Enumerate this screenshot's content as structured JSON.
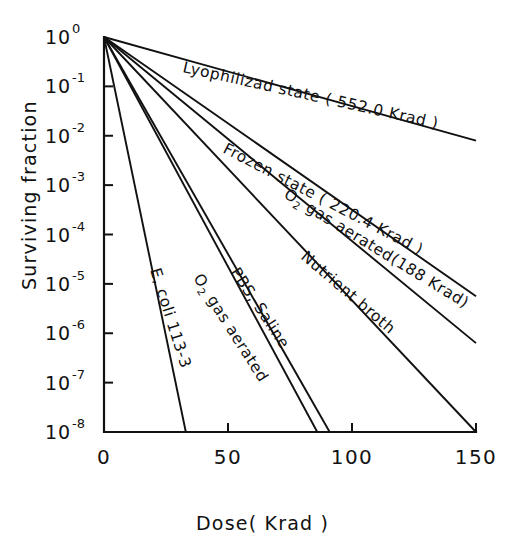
{
  "chart_data": {
    "type": "line",
    "title": "",
    "xlabel": "Dose( Krad )",
    "ylabel": "Surviving fraction",
    "xlim": [
      0,
      150
    ],
    "ylim_log10": [
      -8,
      0
    ],
    "xticks": [
      "0",
      "50",
      "100",
      "150"
    ],
    "xtick_values": [
      0,
      50,
      100,
      150
    ],
    "ytick_labels": [
      "10",
      "10",
      "10",
      "10",
      "10",
      "10",
      "10",
      "10",
      "10"
    ],
    "ytick_exponents": [
      "0",
      "-1",
      "-2",
      "-3",
      "-4",
      "-5",
      "-6",
      "-7",
      "-8"
    ],
    "ytick_values": [
      0,
      -1,
      -2,
      -3,
      -4,
      -5,
      -6,
      -7,
      -8
    ],
    "grid": false,
    "legend": "inline-labels",
    "organism": "E, coli 113-3",
    "series": [
      {
        "name": "Lyophilized state (552.0 Krad)",
        "label": "Lyophilizad    state ( 552.0 Krad )",
        "d10_krad": 552.0,
        "x": [
          0,
          150
        ],
        "y_log10": [
          0,
          -2.1
        ],
        "label_x": 182,
        "label_y": 72,
        "label_rotation": 12.5
      },
      {
        "name": "Frozen state (220.4 Krad)",
        "label": "Frozen state ( 220.4 Krad )",
        "d10_krad": 220.4,
        "x": [
          0,
          150
        ],
        "y_log10": [
          0,
          -5.25
        ],
        "label_x": 222,
        "label_y": 152,
        "label_rotation": 27.5
      },
      {
        "name": "O2 gas aerated (188 Krad)",
        "label": "gas  aerated(188 Krad)",
        "label_prefix": "O",
        "label_subscript": "2",
        "d10_krad": 188.0,
        "x": [
          0,
          150
        ],
        "y_log10": [
          0,
          -6.2
        ],
        "label_x": 283,
        "label_y": 197,
        "label_rotation": 31.5
      },
      {
        "name": "Nutrient broth",
        "label": "Nutrient  broth",
        "x": [
          0,
          150
        ],
        "y_log10": [
          0,
          -8.0
        ],
        "label_x": 300,
        "label_y": 258,
        "label_rotation": 40.5
      },
      {
        "name": "PBS, Saline",
        "label": "PBS,  Saline",
        "x": [
          0,
          91
        ],
        "y_log10": [
          0,
          -8.0
        ],
        "label_x": 230,
        "label_y": 272,
        "label_rotation": 56.5
      },
      {
        "name": "O2 gas aerated",
        "label": "gas  aerated",
        "label_prefix": "O",
        "label_subscript": "2",
        "x": [
          0,
          86
        ],
        "y_log10": [
          0,
          -8.0
        ],
        "label_x": 193,
        "label_y": 278,
        "label_rotation": 57.5
      },
      {
        "name": "E, coli 113-3",
        "label": "E, coli  113-3",
        "x": [
          0,
          33
        ],
        "y_log10": [
          0,
          -8.0
        ],
        "label_x": 150,
        "label_y": 270,
        "label_rotation": 72.5
      }
    ]
  },
  "axes": {
    "y_axis_title": "Surviving fraction",
    "x_axis_title": "Dose( Krad )"
  }
}
